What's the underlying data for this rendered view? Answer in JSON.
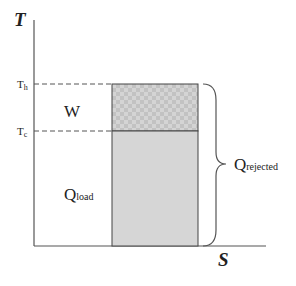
{
  "diagram": {
    "axes": {
      "y_label": "T",
      "x_label": "S"
    },
    "levels": {
      "th": "T",
      "th_sub": "h",
      "tc": "T",
      "tc_sub": "c"
    },
    "regions": {
      "work": {
        "label": "W"
      },
      "load": {
        "label": "Q",
        "sub": "load"
      },
      "rejected": {
        "label": "Q",
        "sub": "rejected"
      }
    },
    "colors": {
      "axis": "#555555",
      "fill": "#d6d6d6",
      "hatch": "#bdbdbd",
      "edge": "#444444"
    }
  }
}
